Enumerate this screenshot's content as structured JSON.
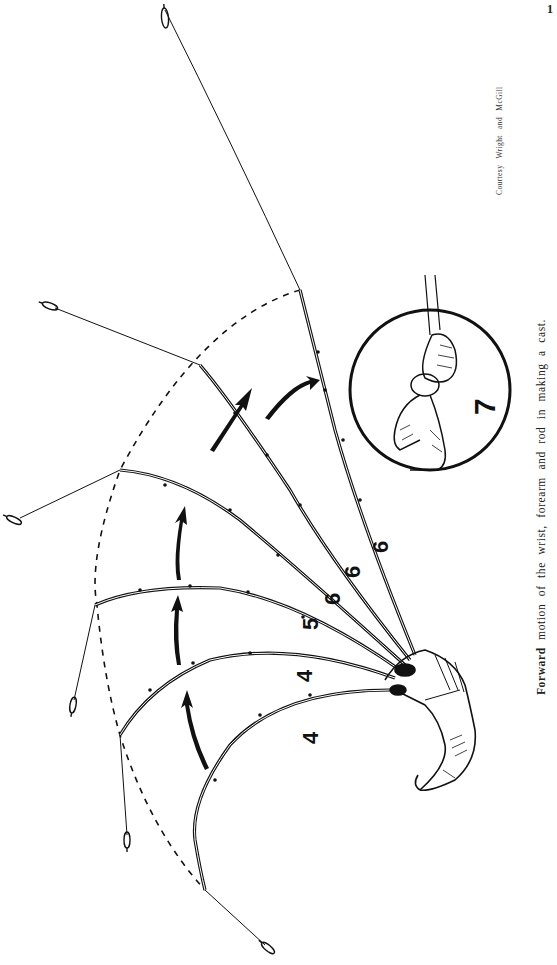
{
  "page": {
    "page_number": "1",
    "credit": "Courtesy Wright and McGill",
    "caption_first_word": "Forward",
    "caption_rest": "motion of the wrist, forearm and rod in making a cast."
  },
  "diagram": {
    "rod_position_labels": [
      "4",
      "4",
      "5",
      "6",
      "6",
      "6"
    ],
    "inset_label": "7",
    "elements": [
      "hand-and-forearm",
      "six-rod-positions",
      "five-motion-arrows",
      "dashed-tip-path",
      "lures",
      "inset-circle-grip-detail"
    ]
  }
}
